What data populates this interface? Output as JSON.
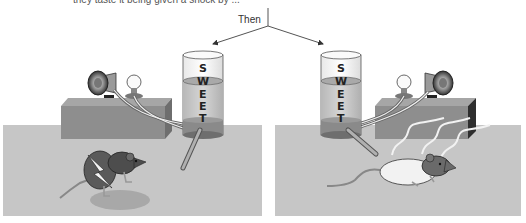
{
  "figure": {
    "caption_top": "they taste it being given a shock by ...",
    "then_label": "Then",
    "jar_label_letters": [
      "S",
      "W",
      "E",
      "E",
      "T"
    ],
    "colors": {
      "floor": "#c4c4c4",
      "box_front": "#8c8c8c",
      "box_top": "#a8a8a8",
      "box_side": "#3a3a3a",
      "liquid": "#bdbdbd",
      "jar_base": "#8a8a8a",
      "arrow": "#555555"
    },
    "panels": [
      {
        "id": "left",
        "description": "rat drinks sweet water and receives shock"
      },
      {
        "id": "right",
        "description": "rat becomes ill / nauseated after drinking sweet water"
      }
    ]
  }
}
